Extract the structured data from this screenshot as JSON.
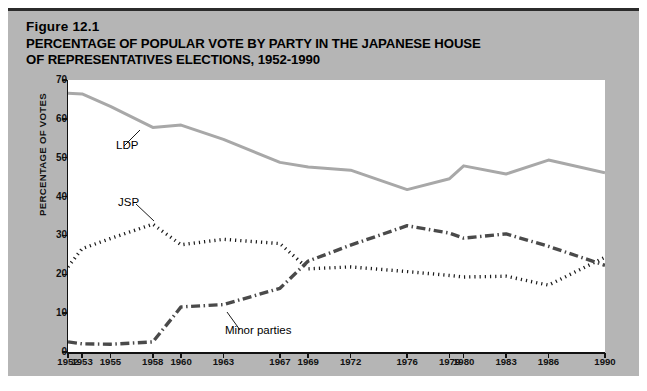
{
  "figure": {
    "number_label": "Figure 12.1",
    "title": "PERCENTAGE OF POPULAR VOTE BY PARTY IN THE JAPANESE HOUSE\nOF REPRESENTATIVES ELECTIONS, 1952-1990"
  },
  "colors": {
    "panel_background": "#b5b5b5",
    "plot_background": "#ffffff",
    "axis": "#111111",
    "ldp_line": "#a8a8a8",
    "jsp_line": "#1a1a1a",
    "minor_line": "#4a4a4a",
    "page_background": "#ffffff",
    "top_rule": "#2b2b2b"
  },
  "chart_data": {
    "type": "line",
    "title": "PERCENTAGE OF POPULAR VOTE BY PARTY IN THE JAPANESE HOUSE OF REPRESENTATIVES ELECTIONS, 1952-1990",
    "xlabel": "",
    "ylabel": "PERCENTAGE OF VOTES",
    "xlim": [
      1952,
      1990
    ],
    "ylim": [
      0,
      70
    ],
    "yticks": [
      0,
      10,
      20,
      30,
      40,
      50,
      60,
      70
    ],
    "xticks": [
      1952,
      1953,
      1955,
      1958,
      1960,
      1963,
      1967,
      1969,
      1972,
      1976,
      1979,
      1980,
      1983,
      1986,
      1990
    ],
    "x": [
      1952,
      1953,
      1955,
      1958,
      1960,
      1963,
      1967,
      1969,
      1972,
      1976,
      1979,
      1980,
      1983,
      1986,
      1990
    ],
    "grid": false,
    "legend_position": "inline-annotations",
    "series": [
      {
        "name": "LDP",
        "style": "solid",
        "color": "#a8a8a8",
        "values": [
          66.6,
          66.4,
          63.2,
          57.8,
          58.4,
          54.7,
          48.8,
          47.6,
          46.8,
          41.8,
          44.6,
          47.9,
          45.8,
          49.4,
          46.1
        ]
      },
      {
        "name": "JSP",
        "style": "dotted",
        "color": "#1a1a1a",
        "values": [
          21.9,
          26.6,
          29.2,
          32.9,
          27.6,
          29.0,
          27.9,
          21.4,
          21.9,
          20.7,
          19.7,
          19.3,
          19.5,
          17.2,
          24.4
        ]
      },
      {
        "name": "Minor parties",
        "style": "dash-dot",
        "color": "#4a4a4a",
        "values": [
          2.6,
          2.1,
          2.0,
          2.6,
          11.6,
          12.2,
          16.4,
          23.4,
          27.5,
          32.5,
          30.6,
          29.3,
          30.4,
          27.2,
          22.3
        ]
      }
    ],
    "annotations": [
      {
        "text": "LDP",
        "series": "LDP"
      },
      {
        "text": "JSP",
        "series": "JSP"
      },
      {
        "text": "Minor parties",
        "series": "Minor parties"
      }
    ]
  }
}
